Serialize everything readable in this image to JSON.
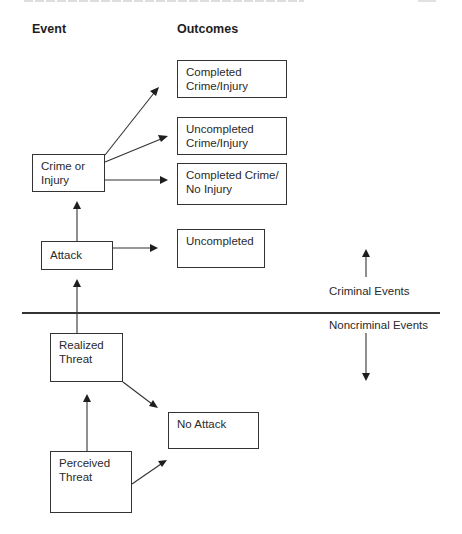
{
  "headings": {
    "event": "Event",
    "outcomes": "Outcomes"
  },
  "event_nodes": {
    "crime_or_injury": {
      "line1": "Crime or",
      "line2": "Injury"
    },
    "attack": {
      "line1": "Attack"
    },
    "realized_threat": {
      "line1": "Realized",
      "line2": "Threat"
    },
    "perceived_threat": {
      "line1": "Perceived",
      "line2": "Threat"
    }
  },
  "outcome_nodes": {
    "completed_crime_injury": {
      "line1": "Completed",
      "line2": "Crime/Injury"
    },
    "uncompleted_crime_injury": {
      "line1": "Uncompleted",
      "line2": "Crime/Injury"
    },
    "completed_crime_no_injury": {
      "line1": "Completed Crime/",
      "line2": "No Injury"
    },
    "uncompleted": {
      "line1": "Uncompleted"
    },
    "no_attack": {
      "line1": "No Attack"
    }
  },
  "zones": {
    "criminal": "Criminal Events",
    "noncriminal": "Noncriminal Events"
  },
  "edges": [
    {
      "from": "Perceived Threat",
      "to": "Realized Threat"
    },
    {
      "from": "Perceived Threat",
      "to": "No Attack"
    },
    {
      "from": "Realized Threat",
      "to": "Attack"
    },
    {
      "from": "Realized Threat",
      "to": "No Attack"
    },
    {
      "from": "Attack",
      "to": "Crime or Injury"
    },
    {
      "from": "Attack",
      "to": "Uncompleted"
    },
    {
      "from": "Crime or Injury",
      "to": "Completed Crime/Injury"
    },
    {
      "from": "Crime or Injury",
      "to": "Uncompleted Crime/Injury"
    },
    {
      "from": "Crime or Injury",
      "to": "Completed Crime/No Injury"
    }
  ],
  "colors": {
    "stroke": "#333333",
    "text": "#2a2a2a",
    "background": "#ffffff"
  }
}
